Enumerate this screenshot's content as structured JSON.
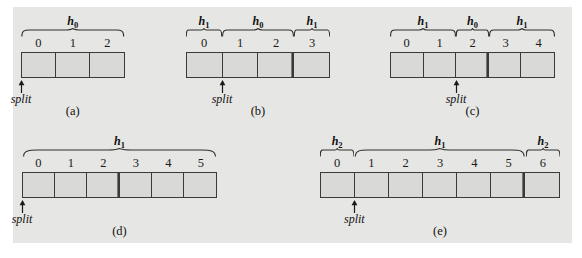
{
  "figure": {
    "type": "diagram",
    "background_color": "#e6e6e4",
    "cell_fill_color": "#d9d9d7",
    "line_color": "#3a3a3a",
    "split_label": "split"
  },
  "panels": [
    {
      "id": "a",
      "label": "(a)",
      "cells": [
        "0",
        "1",
        "2"
      ],
      "double_divider_after": null,
      "split_at_index": 0,
      "braces": [
        {
          "label": "h",
          "subscript": "0",
          "from": 0,
          "to": 2
        }
      ]
    },
    {
      "id": "b",
      "label": "(b)",
      "cells": [
        "0",
        "1",
        "2",
        "3"
      ],
      "double_divider_after": 2,
      "split_at_index": 1,
      "braces": [
        {
          "label": "h",
          "subscript": "1",
          "from": 0,
          "to": 0
        },
        {
          "label": "h",
          "subscript": "0",
          "from": 1,
          "to": 2
        },
        {
          "label": "h",
          "subscript": "1",
          "from": 3,
          "to": 3
        }
      ]
    },
    {
      "id": "c",
      "label": "(c)",
      "cells": [
        "0",
        "1",
        "2",
        "3",
        "4"
      ],
      "double_divider_after": 2,
      "split_at_index": 2,
      "braces": [
        {
          "label": "h",
          "subscript": "1",
          "from": 0,
          "to": 1
        },
        {
          "label": "h",
          "subscript": "0",
          "from": 2,
          "to": 2
        },
        {
          "label": "h",
          "subscript": "1",
          "from": 3,
          "to": 4
        }
      ]
    },
    {
      "id": "d",
      "label": "(d)",
      "cells": [
        "0",
        "1",
        "2",
        "3",
        "4",
        "5"
      ],
      "double_divider_after": 2,
      "split_at_index": 0,
      "braces": [
        {
          "label": "h",
          "subscript": "1",
          "from": 0,
          "to": 5
        }
      ]
    },
    {
      "id": "e",
      "label": "(e)",
      "cells": [
        "0",
        "1",
        "2",
        "3",
        "4",
        "5",
        "6"
      ],
      "double_divider_after": 5,
      "split_at_index": 1,
      "braces": [
        {
          "label": "h",
          "subscript": "2",
          "from": 0,
          "to": 0
        },
        {
          "label": "h",
          "subscript": "1",
          "from": 1,
          "to": 5
        },
        {
          "label": "h",
          "subscript": "2",
          "from": 6,
          "to": 6
        }
      ]
    }
  ],
  "layout": {
    "panel_geometry": [
      {
        "id": "a",
        "left": 21,
        "strip_top": 52,
        "cell_w": 34.5,
        "label_left": 21,
        "label_top": 104
      },
      {
        "id": "b",
        "left": 186,
        "strip_top": 52,
        "cell_w": 36,
        "label_left": 186,
        "label_top": 104
      },
      {
        "id": "c",
        "left": 390,
        "strip_top": 52,
        "cell_w": 33,
        "label_left": 390,
        "label_top": 104
      },
      {
        "id": "d",
        "left": 22,
        "strip_top": 172,
        "cell_w": 32.5,
        "label_left": 22,
        "label_top": 224
      },
      {
        "id": "e",
        "left": 320,
        "strip_top": 172,
        "cell_w": 34.3,
        "label_left": 320,
        "label_top": 224
      }
    ]
  }
}
